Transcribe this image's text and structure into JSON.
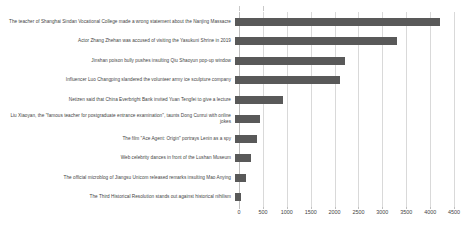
{
  "chart_data": {
    "type": "bar",
    "orientation": "horizontal",
    "title": "",
    "subtitle": "",
    "xlabel": "",
    "ylabel": "",
    "xlim": [
      0,
      4750
    ],
    "xticks": [
      0,
      500,
      1000,
      1500,
      2000,
      2500,
      3000,
      3500,
      4000,
      4500
    ],
    "tick_labels": [
      "0",
      "500",
      "1000",
      "1500",
      "2000",
      "2500",
      "3000",
      "3500",
      "4000",
      "4500"
    ],
    "grid": true,
    "grid_axis": "x",
    "legend": false,
    "legend_position": "none",
    "bar_color": "#595959",
    "gridline_color": "#d9d9d9",
    "categories": [
      "The teacher of Shanghai Sindan Vocational College made a wrong statement about the Nanjing Massacre",
      "Actor Zhang Zhehan was accused of visiting the Yasukuni Shrine in 2019",
      "Jinshan poison bully pushes insulting Qiu Shaoyun pop-up window",
      "Influencer Luo Changping slandered the volunteer army ice sculpture company",
      "Netizen said that China Everbright Bank invited Yuan Tengfei to give a lecture",
      "Liu Xiaoyan, the \"famous teacher for postgraduate entrance examination\", taunts Dong Cunrui with online jokes",
      "The film \"Ace Agent: Origin\" portrays Lenin as a spy",
      "Web celebrity dances in front of the Lushan Museum",
      "The official microblog of Jiangsu Unicom released remarks insulting Mao Anying",
      "The Third Historical Resolution stands out against historical nihilism"
    ],
    "values": [
      4300,
      3400,
      2300,
      2200,
      1000,
      530,
      450,
      330,
      220,
      130
    ]
  }
}
